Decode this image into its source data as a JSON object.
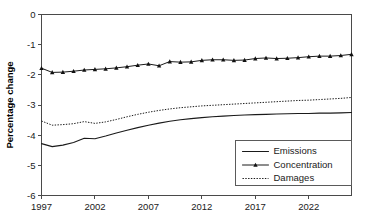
{
  "chart_data": {
    "type": "line",
    "title": "",
    "xlabel": "",
    "ylabel": "Percentage change",
    "xlim": [
      1997,
      2026
    ],
    "ylim": [
      -6,
      0
    ],
    "grid": false,
    "legend_position": "lower-right",
    "x_ticks": [
      1997,
      2002,
      2007,
      2012,
      2017,
      2022
    ],
    "x_tick_labels": [
      "1997",
      "2002",
      "2007",
      "2012",
      "2017",
      "2022"
    ],
    "y_ticks": [
      0,
      -1,
      -2,
      -3,
      -4,
      -5,
      -6
    ],
    "y_tick_labels": [
      "0",
      "-1",
      "-2",
      "-3",
      "-4",
      "-5",
      "-6"
    ],
    "x": [
      1997,
      1998,
      1999,
      2000,
      2001,
      2002,
      2003,
      2004,
      2005,
      2006,
      2007,
      2008,
      2009,
      2010,
      2011,
      2012,
      2013,
      2014,
      2015,
      2016,
      2017,
      2018,
      2019,
      2020,
      2021,
      2022,
      2023,
      2024,
      2025,
      2026
    ],
    "series": [
      {
        "name": "Emissions",
        "style": "solid",
        "marker": "none",
        "values": [
          -4.28,
          -4.38,
          -4.33,
          -4.24,
          -4.1,
          -4.12,
          -4.03,
          -3.93,
          -3.84,
          -3.75,
          -3.67,
          -3.6,
          -3.54,
          -3.49,
          -3.45,
          -3.42,
          -3.39,
          -3.37,
          -3.35,
          -3.33,
          -3.32,
          -3.31,
          -3.3,
          -3.29,
          -3.28,
          -3.28,
          -3.27,
          -3.27,
          -3.26,
          -3.25
        ]
      },
      {
        "name": "Concentration",
        "style": "solid",
        "marker": "triangle",
        "values": [
          -1.78,
          -1.92,
          -1.91,
          -1.88,
          -1.84,
          -1.82,
          -1.8,
          -1.77,
          -1.73,
          -1.68,
          -1.64,
          -1.7,
          -1.56,
          -1.58,
          -1.57,
          -1.52,
          -1.5,
          -1.5,
          -1.52,
          -1.51,
          -1.46,
          -1.44,
          -1.46,
          -1.45,
          -1.43,
          -1.4,
          -1.38,
          -1.38,
          -1.36,
          -1.32
        ]
      },
      {
        "name": "Damages",
        "style": "dotted",
        "marker": "none",
        "values": [
          -3.53,
          -3.67,
          -3.65,
          -3.62,
          -3.55,
          -3.61,
          -3.56,
          -3.48,
          -3.39,
          -3.31,
          -3.24,
          -3.18,
          -3.13,
          -3.09,
          -3.06,
          -3.03,
          -3.01,
          -2.99,
          -2.97,
          -2.95,
          -2.93,
          -2.91,
          -2.89,
          -2.87,
          -2.85,
          -2.84,
          -2.82,
          -2.8,
          -2.78,
          -2.75
        ]
      }
    ],
    "legend": [
      {
        "label": "Emissions",
        "style": "solid",
        "marker": "none"
      },
      {
        "label": "Concentration",
        "style": "solid",
        "marker": "triangle"
      },
      {
        "label": "Damages",
        "style": "dotted",
        "marker": "none"
      }
    ]
  },
  "colors": {
    "line": "#1a1a1a",
    "axis": "#4a4a4a",
    "background": "#ffffff",
    "legend_border": "#5a5a5a"
  }
}
